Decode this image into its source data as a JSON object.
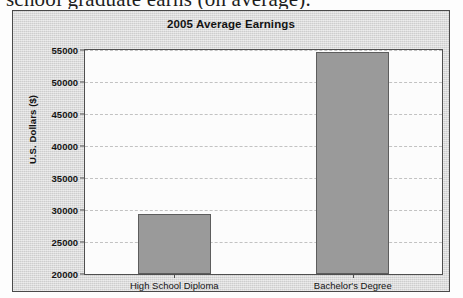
{
  "document": {
    "cutoff_line": "school graduate earns (on average)."
  },
  "figure": {
    "title": "2005 Average Earnings"
  },
  "chart_data": {
    "type": "bar",
    "title": "2005 Average Earnings",
    "xlabel": "",
    "ylabel": "U.S. Dollars ($)",
    "categories": [
      "High School Diploma",
      "Bachelor's Degree"
    ],
    "values": [
      29400,
      54700
    ],
    "ylim": [
      20000,
      55000
    ],
    "ytick_step": 5000,
    "yticks": [
      20000,
      25000,
      30000,
      35000,
      40000,
      45000,
      50000,
      55000
    ],
    "ytick_labels": [
      "20000",
      "25000",
      "30000",
      "35000",
      "40000",
      "45000",
      "50000",
      "55000"
    ],
    "grid": true,
    "legend": false,
    "bar_color": "#9a9a9a",
    "bar_edge_color": "#5d5d5d",
    "plot_background": "#fcfcfc",
    "figure_background": "#d8d8d8"
  }
}
